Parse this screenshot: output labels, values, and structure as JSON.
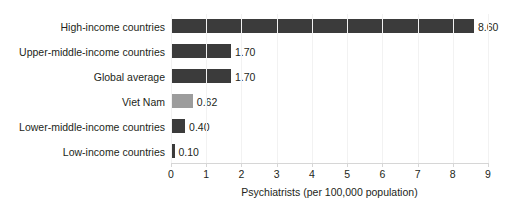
{
  "chart_data": {
    "type": "bar",
    "orientation": "horizontal",
    "title": "",
    "xlabel": "Psychiatrists (per 100,000 population)",
    "ylabel": "",
    "xlim": [
      0,
      9
    ],
    "xticks": [
      "0",
      "1",
      "2",
      "3",
      "4",
      "5",
      "6",
      "7",
      "8",
      "9"
    ],
    "grid": false,
    "legend": "none",
    "categories": [
      "High-income countries",
      "Upper-middle-income countries",
      "Global average",
      "Viet Nam",
      "Lower-middle-income countries",
      "Low-income countries"
    ],
    "values": [
      8.6,
      1.7,
      1.7,
      0.62,
      0.4,
      0.1
    ],
    "value_labels": [
      "8.60",
      "1.70",
      "1.70",
      "0.62",
      "0.40",
      "0.10"
    ],
    "bar_colors": [
      "#3b3b3b",
      "#3b3b3b",
      "#3b3b3b",
      "#9c9c9c",
      "#3b3b3b",
      "#3b3b3b"
    ],
    "highlight_category": "Viet Nam",
    "highlight_color": "#9c9c9c",
    "default_color": "#3b3b3b",
    "axis_color": "#d6d6d6"
  },
  "axis": {
    "title": "Psychiatrists (per 100,000 population)"
  },
  "title_sliver": ""
}
